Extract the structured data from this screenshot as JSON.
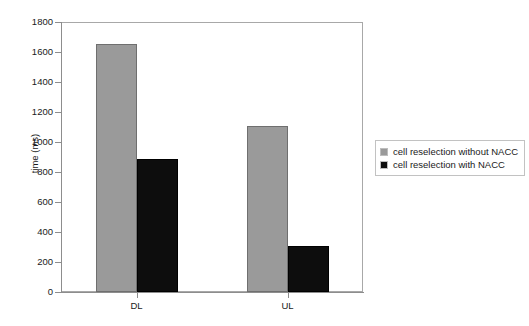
{
  "chart_data": {
    "type": "bar",
    "title": "",
    "xlabel": "",
    "ylabel": "time (ms)",
    "categories": [
      "DL",
      "UL"
    ],
    "series": [
      {
        "name": "cell reselection without NACC",
        "color": "#9a9a9a",
        "values": [
          1655,
          1110
        ]
      },
      {
        "name": "cell reselection with NACC",
        "color": "#0d0d0d",
        "values": [
          890,
          310
        ]
      }
    ],
    "ylim": [
      0,
      1800
    ],
    "ytick_step": 200,
    "yticks": [
      0,
      200,
      400,
      600,
      800,
      1000,
      1200,
      1400,
      1600,
      1800
    ],
    "ytick_labels": [
      "0",
      "200",
      "400",
      "600",
      "800",
      "1000",
      "1200",
      "1400",
      "1600",
      "1800"
    ],
    "grid": true,
    "grid_style": "dashed-horizontal",
    "legend_position": "right"
  },
  "legend": {
    "entries": [
      {
        "label": "cell reselection without NACC",
        "swatch": "gray-square-icon"
      },
      {
        "label": "cell reselection with NACC",
        "swatch": "black-square-icon"
      }
    ]
  }
}
